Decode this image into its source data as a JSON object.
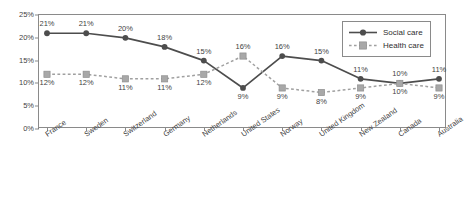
{
  "chart_data": {
    "type": "line",
    "title": "",
    "xlabel": "",
    "ylabel": "",
    "ylim": [
      0,
      25
    ],
    "yticks": [
      "0%",
      "5%",
      "10%",
      "15%",
      "20%",
      "25%"
    ],
    "grid": false,
    "legend_position": "top-right",
    "categories": [
      "France",
      "Sweden",
      "Switzerland",
      "Germany",
      "Netherlands",
      "United States",
      "Norway",
      "United Kingdom",
      "New Zealand",
      "Canada",
      "Australia"
    ],
    "series": [
      {
        "name": "Social care",
        "color": "#4d4d4d",
        "marker": "circle",
        "line_style": "solid",
        "values": [
          21,
          21,
          20,
          18,
          15,
          9,
          16,
          15,
          11,
          10,
          11
        ],
        "labels": [
          "21%",
          "21%",
          "20%",
          "18%",
          "15%",
          "9%",
          "16%",
          "15%",
          "11%",
          "10%",
          "11%"
        ],
        "label_side": [
          "above",
          "above",
          "above",
          "above",
          "above",
          "below",
          "above",
          "above",
          "above",
          "above",
          "above"
        ]
      },
      {
        "name": "Health care",
        "color": "#a0a0a0",
        "marker": "square",
        "line_style": "dashed",
        "values": [
          12,
          12,
          11,
          11,
          12,
          16,
          9,
          8,
          9,
          10,
          9
        ],
        "labels": [
          "12%",
          "12%",
          "11%",
          "11%",
          "12%",
          "16%",
          "9%",
          "8%",
          "9%",
          "10%",
          "9%"
        ],
        "label_side": [
          "below",
          "below",
          "below",
          "below",
          "below",
          "above",
          "below",
          "below",
          "below",
          "below",
          "below"
        ]
      }
    ]
  },
  "legend": {
    "items": [
      {
        "label": "Social care"
      },
      {
        "label": "Health care"
      }
    ]
  }
}
